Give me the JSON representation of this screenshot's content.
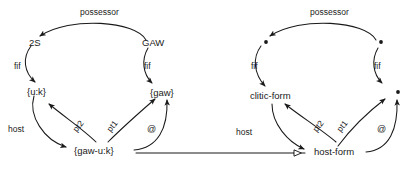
{
  "figure": {
    "type": "linguistic-network-diagram",
    "background": "#ffffff",
    "stroke": "#1a1a1a"
  },
  "left_diagram": {
    "name": "instance-network",
    "nodes": {
      "top_left": "2S",
      "top_right": "GAW",
      "mid_left": "{u:k}",
      "mid_right": "{gaw}",
      "bottom": "{gaw-u:k}"
    },
    "edges": {
      "possessor": "possessor",
      "fif_left": "fif",
      "fif_right": "fif",
      "host": "host",
      "pt2": "pt2",
      "pt1": "pt1",
      "at": "@"
    }
  },
  "right_diagram": {
    "name": "schema-network",
    "nodes": {
      "top_left": "•",
      "top_right": "•",
      "mid_left": "clitic-form",
      "mid_right": "•",
      "bottom": "host-form"
    },
    "edges": {
      "possessor": "possessor",
      "fif_left": "fif",
      "fif_right": "fif",
      "host": "host",
      "pt2": "pt2",
      "pt1": "pt1",
      "at": "@"
    }
  },
  "connector": {
    "name": "instantiation-link",
    "arrowhead": "hollow-triangle",
    "direction": "left-to-right-pointing-left"
  }
}
